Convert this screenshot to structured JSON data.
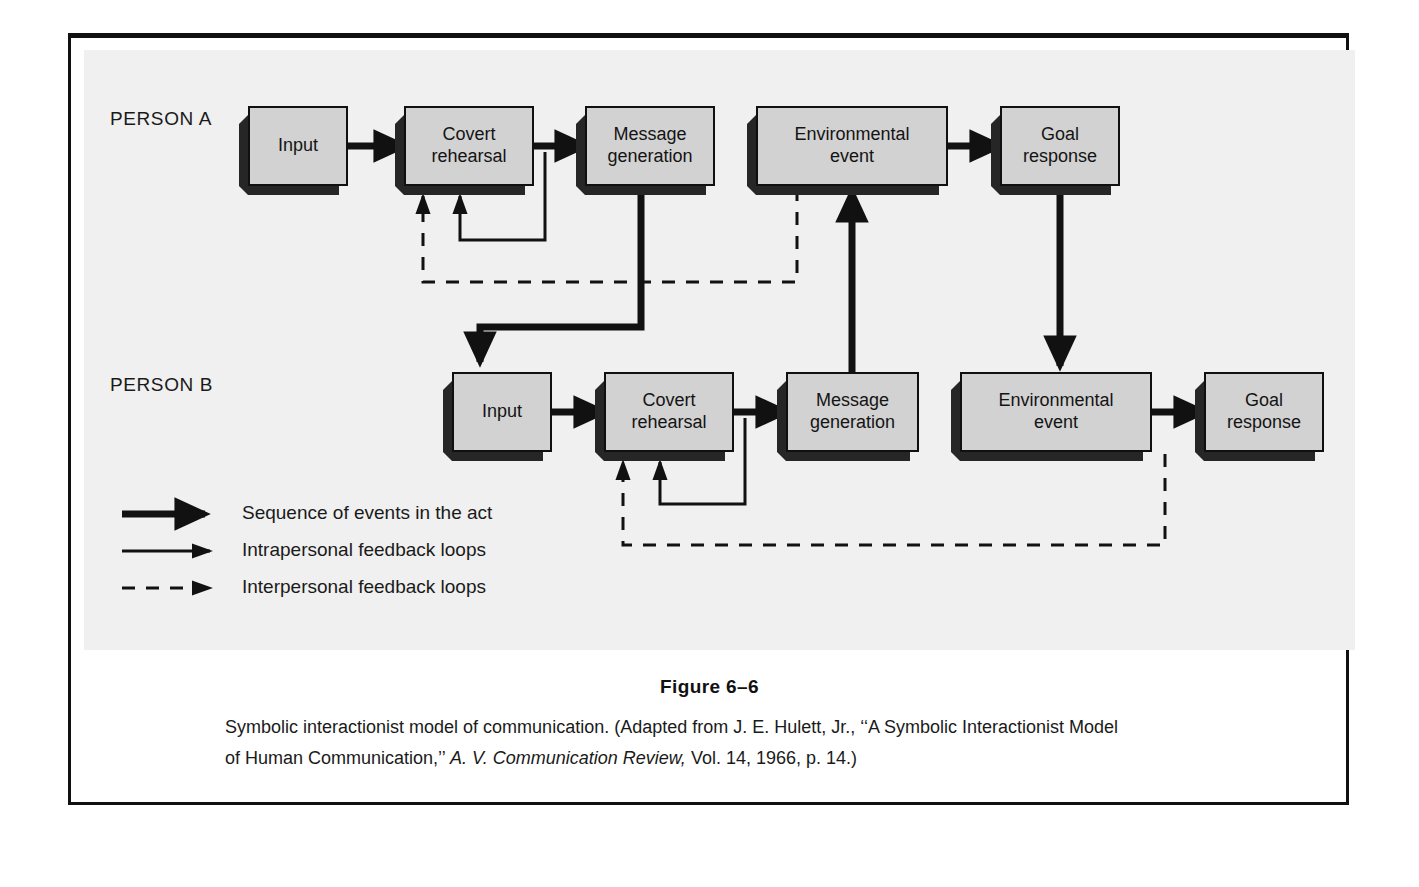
{
  "figure": {
    "number": "Figure 6–6",
    "caption_part1": "Symbolic interactionist model of communication. (Adapted from J. E. Hulett, Jr., ‘‘A Symbolic Interactionist Model of Human Communication,’’ ",
    "caption_italic": "A. V. Communication Review,",
    "caption_part2": " Vol. 14, 1966, p. 14.)"
  },
  "rows": {
    "person_a": {
      "label": "PERSON A",
      "nodes": [
        {
          "id": "a-input",
          "text": "Input"
        },
        {
          "id": "a-covert",
          "text": "Covert\nrehearsal"
        },
        {
          "id": "a-message",
          "text": "Message\ngeneration"
        },
        {
          "id": "a-environ",
          "text": "Environmental\nevent"
        },
        {
          "id": "a-goal",
          "text": "Goal\nresponse"
        }
      ]
    },
    "person_b": {
      "label": "PERSON B",
      "nodes": [
        {
          "id": "b-input",
          "text": "Input"
        },
        {
          "id": "b-covert",
          "text": "Covert\nrehearsal"
        },
        {
          "id": "b-message",
          "text": "Message\ngeneration"
        },
        {
          "id": "b-environ",
          "text": "Environmental\nevent"
        },
        {
          "id": "b-goal",
          "text": "Goal\nresponse"
        }
      ]
    }
  },
  "legend": [
    {
      "style": "thick-solid",
      "label": "Sequence of events in the act"
    },
    {
      "style": "thin-solid",
      "label": "Intrapersonal feedback loops"
    },
    {
      "style": "thin-dashed",
      "label": "Interpersonal feedback loops"
    }
  ],
  "colors": {
    "panel_background": "#f0f0f0",
    "page_background": "#ffffff",
    "box_fill": "#d2d2d2",
    "box_border": "#101010",
    "box_shadow": "#262626",
    "ink": "#111111"
  }
}
